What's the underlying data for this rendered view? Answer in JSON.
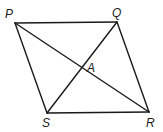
{
  "diagram": {
    "type": "rhombus-with-diagonals",
    "vertices": [
      {
        "id": "P",
        "label": "P",
        "x": 15,
        "y": 23
      },
      {
        "id": "Q",
        "label": "Q",
        "x": 117,
        "y": 22
      },
      {
        "id": "R",
        "label": "R",
        "x": 149,
        "y": 112
      },
      {
        "id": "S",
        "label": "S",
        "x": 47,
        "y": 113
      }
    ],
    "intersection": {
      "id": "A",
      "label": "A",
      "x": 82,
      "y": 68
    },
    "edges": [
      [
        "P",
        "Q"
      ],
      [
        "Q",
        "R"
      ],
      [
        "R",
        "S"
      ],
      [
        "S",
        "P"
      ]
    ],
    "diagonals": [
      [
        "P",
        "R"
      ],
      [
        "Q",
        "S"
      ]
    ],
    "labels": {
      "P": "P",
      "Q": "Q",
      "R": "R",
      "S": "S",
      "A": "A"
    },
    "colors": {
      "stroke": "#1a1a1a",
      "background": "#ffffff"
    }
  }
}
